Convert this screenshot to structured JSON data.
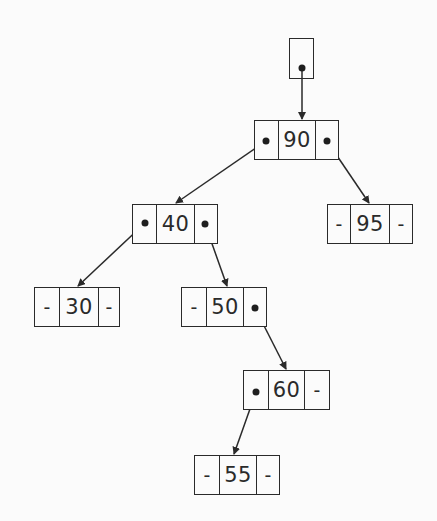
{
  "diagram": {
    "type": "binary-search-tree",
    "null_marker": "-",
    "root_pointer": {
      "label": ""
    },
    "nodes": [
      {
        "id": "n90",
        "key": "90",
        "left": "n40",
        "right": "n95"
      },
      {
        "id": "n40",
        "key": "40",
        "left": "n30",
        "right": "n50"
      },
      {
        "id": "n95",
        "key": "95",
        "left": "-",
        "right": "-"
      },
      {
        "id": "n30",
        "key": "30",
        "left": "-",
        "right": "-"
      },
      {
        "id": "n50",
        "key": "50",
        "left": "-",
        "right": "n60"
      },
      {
        "id": "n60",
        "key": "60",
        "left": "n55",
        "right": "-"
      },
      {
        "id": "n55",
        "key": "55",
        "left": "-",
        "right": "-"
      }
    ],
    "colors": {
      "stroke": "#2a2a2a",
      "background": "#fbfbfb"
    }
  }
}
